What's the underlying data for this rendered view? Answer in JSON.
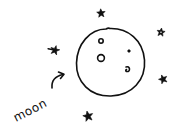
{
  "drawing": {
    "label": "moon",
    "ink_color": "#111111",
    "background_color": "#ffffff",
    "moon": {
      "cx": 110,
      "cy": 62,
      "r": 34
    },
    "craters": [
      {
        "name": "crater-small-top",
        "cx": 101,
        "cy": 41,
        "r": 2.2
      },
      {
        "name": "crater-medium-left",
        "cx": 101,
        "cy": 58,
        "r": 3.4
      },
      {
        "name": "crater-dot-right",
        "cx": 129,
        "cy": 51,
        "r": 1.4
      },
      {
        "name": "crater-swirl-right",
        "cx": 127,
        "cy": 69,
        "r": 2.4
      }
    ],
    "stars": [
      {
        "name": "star-top",
        "x": 101,
        "y": 13
      },
      {
        "name": "star-top-right",
        "x": 161,
        "y": 32
      },
      {
        "name": "star-left",
        "x": 55,
        "y": 50
      },
      {
        "name": "star-right",
        "x": 163,
        "y": 79
      },
      {
        "name": "star-bottom",
        "x": 88,
        "y": 116
      }
    ],
    "icons": {
      "arrow": "curved-arrow-pointing-to-moon",
      "star": "hand-drawn-star"
    }
  }
}
